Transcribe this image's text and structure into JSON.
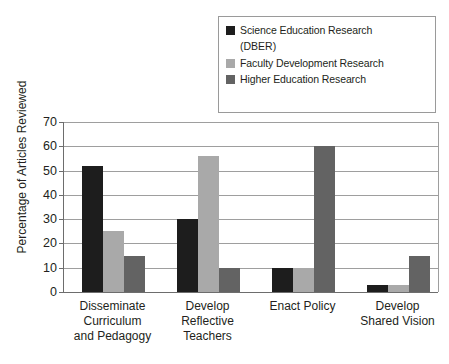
{
  "chart_data": {
    "type": "bar",
    "title": "",
    "xlabel": "",
    "ylabel": "Percentage of Articles Reviewed",
    "ylim": [
      0,
      70
    ],
    "ytick_step": 10,
    "yticks": [
      70,
      60,
      50,
      40,
      30,
      20,
      10,
      0
    ],
    "grid": true,
    "legend_position": "top-right",
    "categories": [
      "Disseminate Curriculum and Pedagogy",
      "Develop Reflective Teachers",
      "Enact Policy",
      "Develop Shared Vision"
    ],
    "category_lines": [
      [
        "Disseminate",
        "Curriculum",
        "and Pedagogy"
      ],
      [
        "Develop",
        "Reflective",
        "Teachers"
      ],
      [
        "Enact Policy"
      ],
      [
        "Develop",
        "Shared Vision"
      ]
    ],
    "series": [
      {
        "name": "Science Education Research (DBER)",
        "legend_line1": "Science Education Research",
        "legend_line2": "(DBER)",
        "color": "#1d1d1d",
        "values": [
          52,
          30,
          10,
          3
        ]
      },
      {
        "name": "Faculty Development Research",
        "legend_line1": "Faculty Development Research",
        "legend_line2": "",
        "color": "#a9a9a9",
        "values": [
          25,
          56,
          10,
          3
        ]
      },
      {
        "name": "Higher Education Research",
        "legend_line1": "Higher Education Research",
        "legend_line2": "",
        "color": "#636363",
        "values": [
          15,
          10,
          60,
          15
        ]
      }
    ]
  },
  "colors": {
    "axis": "#6d6d6d",
    "grid": "#9e9e9e",
    "legend_border": "#9a9a9a",
    "background": "#ffffff",
    "text": "#231f20"
  }
}
